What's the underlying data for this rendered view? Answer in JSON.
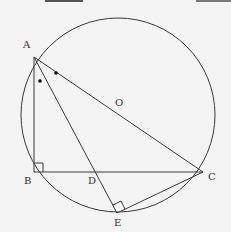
{
  "diagram": {
    "type": "geometry",
    "circle": {
      "center_label": "O",
      "cx": 118,
      "cy": 115,
      "r": 97
    },
    "points": {
      "A": {
        "label": "A",
        "x": 34,
        "y": 57
      },
      "B": {
        "label": "B",
        "x": 34,
        "y": 172
      },
      "C": {
        "label": "C",
        "x": 203,
        "y": 172
      },
      "D": {
        "label": "D",
        "x": 97,
        "y": 172
      },
      "E": {
        "label": "E",
        "x": 117,
        "y": 213
      },
      "O": {
        "label": "O",
        "x": 118,
        "y": 114
      }
    },
    "segments": [
      "AB",
      "BC",
      "AC",
      "AE",
      "EC"
    ],
    "right_angles": [
      "B",
      "E"
    ],
    "angle_marks": [
      "BAD",
      "DAC"
    ],
    "colors": {
      "line": "#3a3a3a",
      "background": "#f4f4f4"
    }
  }
}
